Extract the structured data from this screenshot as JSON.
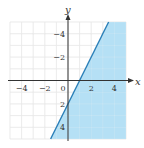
{
  "chart_data": {
    "type": "line",
    "title": "",
    "xlabel": "x",
    "ylabel": "y",
    "xlim": [
      -5,
      5
    ],
    "ylim": [
      -5,
      5
    ],
    "grid": true,
    "x_ticks": [
      -4,
      -2,
      0,
      2,
      4
    ],
    "y_ticks": [
      -4,
      -2,
      2,
      4
    ],
    "tick_labels": {
      "x": [
        "−4",
        "−2",
        "0",
        "2",
        "4"
      ],
      "y": [
        "4",
        "2",
        "−2",
        "−4"
      ]
    },
    "series": [
      {
        "name": "boundary",
        "equation": "y = 2x - 2",
        "style": "solid",
        "x": [
          -1.5,
          3.5
        ],
        "y": [
          -5,
          5
        ]
      }
    ],
    "shaded_region": "y <= 2x - 2",
    "colors": {
      "shade": "#a8daf3",
      "line": "#2a7fb8",
      "grid": "#d8d8d8",
      "axis": "#333333"
    }
  }
}
